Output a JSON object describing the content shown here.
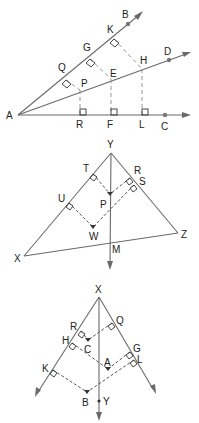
{
  "figures": [
    {
      "id": "angle-bisector-theorem",
      "vertex": "A",
      "rays": [
        "B",
        "D",
        "C"
      ],
      "feet_on_AB": [
        "Q",
        "G",
        "K"
      ],
      "points_on_AD": [
        "P",
        "E",
        "H"
      ],
      "feet_on_AC": [
        "R",
        "F",
        "L"
      ],
      "labels": {
        "A": "A",
        "B": "B",
        "C": "C",
        "D": "D",
        "K": "K",
        "G": "G",
        "Q": "Q",
        "H": "H",
        "E": "E",
        "P": "P",
        "R": "R",
        "F": "F",
        "L": "L"
      }
    },
    {
      "id": "triangle-bisector",
      "triangle": [
        "X",
        "Y",
        "Z"
      ],
      "bisector_point": "M",
      "labels": {
        "Y": "Y",
        "T": "T",
        "R": "R",
        "S": "S",
        "U": "U",
        "P": "P",
        "W": "W",
        "X": "X",
        "Z": "Z",
        "M": "M"
      }
    },
    {
      "id": "angle-bisector-converse",
      "vertex": "X",
      "labels": {
        "X": "X",
        "R": "R",
        "Q": "Q",
        "H": "H",
        "C": "C",
        "G": "G",
        "A": "A",
        "L": "L",
        "K": "K",
        "B": "B",
        "Y": "Y"
      }
    }
  ],
  "colors": {
    "line": "#6a6a6a",
    "dashed": "#555555",
    "text": "#222222"
  }
}
